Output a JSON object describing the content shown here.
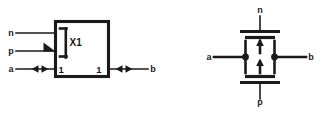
{
  "figure": {
    "name": "transmission-gate-symbol-and-schematic",
    "background_color": "#ffffff",
    "line_color": "#1a1a1a",
    "symbol_block": {
      "reference_label": "X1",
      "qualifier_icon": "dynamic-input-triangle-icon",
      "bracket_icon": "grouping-bracket-icon",
      "control_inputs": [
        {
          "name": "n",
          "label": "n",
          "position": "top-left"
        },
        {
          "name": "p",
          "label": "p",
          "position": "mid-left",
          "marker": "dynamic-input-triangle-icon"
        }
      ],
      "bidirectional_ports": [
        {
          "name": "a",
          "label": "a",
          "pin_label": "1",
          "side": "left",
          "arrow": "double-arrow-icon"
        },
        {
          "name": "b",
          "label": "b",
          "pin_label": "1",
          "side": "right",
          "arrow": "double-arrow-icon"
        }
      ]
    },
    "schematic": {
      "title": "cmos-transmission-gate",
      "gate_terminals": [
        {
          "name": "n",
          "label": "n",
          "position": "top",
          "device": "nmos"
        },
        {
          "name": "p",
          "label": "p",
          "position": "bottom",
          "device": "pmos"
        }
      ],
      "channel_terminals": [
        {
          "name": "a",
          "label": "a",
          "side": "left",
          "junction": "filled-dot"
        },
        {
          "name": "b",
          "label": "b",
          "side": "right",
          "junction": "filled-dot"
        }
      ],
      "substrate_arrows": [
        {
          "name": "nmos-bulk-arrow",
          "direction": "up"
        },
        {
          "name": "pmos-bulk-arrow",
          "direction": "up"
        }
      ]
    }
  }
}
